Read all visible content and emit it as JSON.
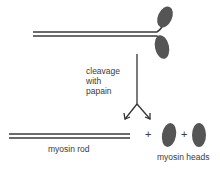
{
  "diagram": {
    "step_label_lines": [
      "cleavage",
      "with",
      "papain"
    ],
    "products": {
      "rod_label": "myosin rod",
      "heads_label": "myosin heads",
      "plus_1": "+",
      "plus_2": "+"
    },
    "colors": {
      "line": "#3a3a3a",
      "head_fill": "#555555",
      "background": "#ffffff"
    }
  }
}
